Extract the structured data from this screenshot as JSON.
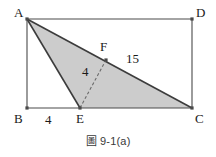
{
  "figure": {
    "caption": "圖 9-1(a)",
    "background_color": "#ffffff",
    "shade_color": "#cccccc",
    "stroke_color": "#4a4a4a",
    "solid_stroke_color": "#3c3c3c",
    "label_color": "#1a1a1a"
  },
  "vertices": {
    "a": {
      "label": "A",
      "x": 27,
      "y": 19
    },
    "b": {
      "label": "B",
      "x": 27,
      "y": 108
    },
    "c": {
      "label": "C",
      "x": 192,
      "y": 108
    },
    "d": {
      "label": "D",
      "x": 192,
      "y": 19
    },
    "e": {
      "label": "E",
      "x": 80,
      "y": 108
    },
    "f": {
      "label": "F",
      "x": 106,
      "y": 60
    }
  },
  "measures": {
    "be": {
      "label": "4",
      "x": 45,
      "y": 113
    },
    "ef": {
      "label": "4",
      "x": 82,
      "y": 65
    },
    "fc": {
      "label": "15",
      "x": 126,
      "y": 52
    }
  },
  "label_positions": {
    "a": {
      "x": 14,
      "y": 6
    },
    "b": {
      "x": 14,
      "y": 112
    },
    "c": {
      "x": 195,
      "y": 112
    },
    "d": {
      "x": 196,
      "y": 6
    },
    "e": {
      "x": 76,
      "y": 112
    },
    "f": {
      "x": 100,
      "y": 40
    }
  },
  "shapes": {
    "rectangle": "A-B-C-D outline",
    "shaded_triangle": "A-E-C",
    "dashed_segment": "E-F",
    "solid_segments": [
      "A-E",
      "A-C"
    ]
  }
}
